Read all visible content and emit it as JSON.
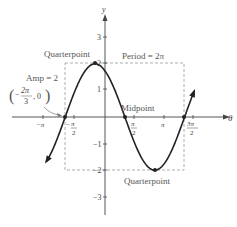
{
  "chart_data": {
    "type": "line",
    "function": "y = 2 sin(theta + 2pi/3)",
    "xlabel": "θ",
    "ylabel": "y",
    "xlim": [
      -3.6,
      5.2
    ],
    "ylim": [
      -3.6,
      4.0
    ],
    "x_ticks": [
      "-π",
      "π/2",
      "π",
      "3π/2"
    ],
    "x_tick_extra": [
      "-π/2"
    ],
    "y_ticks": [
      "3",
      "2",
      "1",
      "-1",
      "-2",
      "-3"
    ],
    "series": [
      {
        "name": "sinusoid",
        "amplitude": 2,
        "period": "2π",
        "phase_shift": "-2π/3",
        "points": [
          {
            "theta": -2.094,
            "y": 0,
            "label": "(-2π/3, 0)"
          },
          {
            "theta": -0.524,
            "y": 2,
            "label": "Quarterpoint"
          },
          {
            "theta": 1.047,
            "y": 0,
            "label": "Midpoint"
          },
          {
            "theta": 2.618,
            "y": -2,
            "label": "Quarterpoint"
          },
          {
            "theta": 4.189,
            "y": 0,
            "label": ""
          }
        ]
      }
    ],
    "annotations": {
      "top_quarterpoint": "Quarterpoint",
      "bottom_quarterpoint": "Quarterpoint",
      "midpoint": "Midpoint",
      "amplitude": "Amp = 2",
      "period": "Period = 2π",
      "start_point_num": "2π",
      "start_point_den": "3",
      "start_point_prefix": "−",
      "start_point_suffix": ", 0"
    },
    "grid": false,
    "legend": "none"
  },
  "axes": {
    "x_label": "θ",
    "y_label": "y",
    "ticks": {
      "neg_pi": "−π",
      "pi": "π",
      "pi_sym": "π",
      "two": "2",
      "three_pi": "3π",
      "y3": "3",
      "y2": "2",
      "y1": "1",
      "yn1": "−1",
      "yn2": "−2",
      "yn3": "−3"
    }
  },
  "colors": {
    "curve": "#222222",
    "axis": "#444444",
    "dashed": "#999999",
    "text": "#555555"
  }
}
